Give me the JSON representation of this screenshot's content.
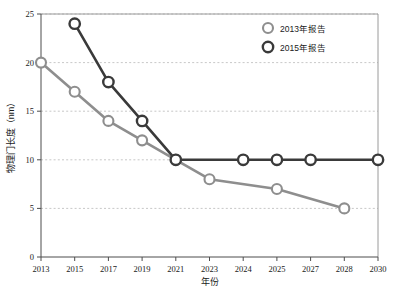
{
  "chart_data": {
    "type": "line",
    "title": "",
    "xlabel": "年份",
    "ylabel": "物理门长度（nm）",
    "categories": [
      "2013",
      "2015",
      "2017",
      "2019",
      "2021",
      "2023",
      "2024",
      "2025",
      "2027",
      "2028",
      "2030"
    ],
    "ylim": [
      0,
      25
    ],
    "yticks": [
      0,
      5,
      10,
      15,
      20,
      25
    ],
    "ytick_labels": [
      "0",
      "5",
      "10",
      "15",
      "20",
      "25"
    ],
    "grid": "horizontal-dashed",
    "legend_position": "top-right",
    "series": [
      {
        "name": "2013年报告",
        "color": "#8e8e8e",
        "points": [
          {
            "x": "2013",
            "y": 20
          },
          {
            "x": "2015",
            "y": 17
          },
          {
            "x": "2017",
            "y": 14
          },
          {
            "x": "2019",
            "y": 12
          },
          {
            "x": "2021",
            "y": 10
          },
          {
            "x": "2023",
            "y": 8
          },
          {
            "x": "2025",
            "y": 7
          },
          {
            "x": "2028",
            "y": 5
          }
        ]
      },
      {
        "name": "2015年报告",
        "color": "#3a3a3a",
        "points": [
          {
            "x": "2015",
            "y": 24
          },
          {
            "x": "2017",
            "y": 18
          },
          {
            "x": "2019",
            "y": 14
          },
          {
            "x": "2021",
            "y": 10
          },
          {
            "x": "2024",
            "y": 10
          },
          {
            "x": "2025",
            "y": 10
          },
          {
            "x": "2027",
            "y": 10
          },
          {
            "x": "2030",
            "y": 10
          }
        ]
      }
    ]
  },
  "legend": {
    "items": [
      {
        "label": "2013年报告",
        "marker": "circle-outline-gray"
      },
      {
        "label": "2015年报告",
        "marker": "circle-outline-dark"
      }
    ]
  },
  "axes": {
    "x_title": "年份",
    "y_title": "物理门长度（nm）"
  }
}
